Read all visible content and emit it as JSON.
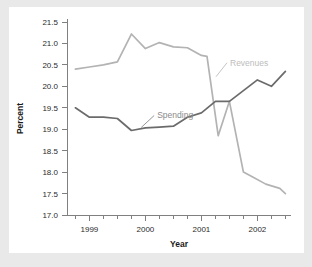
{
  "chart_data": {
    "type": "line",
    "title": "",
    "xlabel": "Year",
    "ylabel": "Percent",
    "ylim": [
      17.0,
      21.5
    ],
    "ytick_labels": [
      "21.5",
      "21.0",
      "20.5",
      "20.0",
      "19.5",
      "19.0",
      "18.5",
      "18.0",
      "17.5",
      "17.0"
    ],
    "ytick_values": [
      21.5,
      21.0,
      20.5,
      20.0,
      19.5,
      19.0,
      18.5,
      18.0,
      17.5,
      17.0
    ],
    "xtick_labels": [
      "1999",
      "2000",
      "2001",
      "2002"
    ],
    "xtick_values": [
      1999,
      2000,
      2001,
      2002
    ],
    "xlim": [
      1998.6,
      2002.6
    ],
    "x_minor_step": 0.25,
    "grid": false,
    "legend": "inline-labels",
    "series": [
      {
        "name": "Revenues",
        "color": "#b3b3b3",
        "label_color": "#bdbdbd",
        "x": [
          1998.75,
          1999.0,
          1999.25,
          1999.5,
          1999.75,
          2000.0,
          2000.25,
          2000.5,
          2000.75,
          2001.0,
          2001.1,
          2001.3,
          2001.5,
          2001.75,
          2001.9,
          2002.15,
          2002.4,
          2002.5
        ],
        "values": [
          20.4,
          20.45,
          20.5,
          20.57,
          21.22,
          20.88,
          21.02,
          20.92,
          20.9,
          20.72,
          20.7,
          18.85,
          19.65,
          18.0,
          17.9,
          17.72,
          17.62,
          17.5
        ]
      },
      {
        "name": "Spending",
        "color": "#6b6b6b",
        "label_color": "#8a8a8a",
        "x": [
          1998.75,
          1999.0,
          1999.25,
          1999.5,
          1999.75,
          2000.0,
          2000.25,
          2000.5,
          2000.75,
          2001.0,
          2001.25,
          2001.5,
          2001.75,
          2002.0,
          2002.25,
          2002.5
        ],
        "values": [
          19.5,
          19.28,
          19.28,
          19.25,
          18.97,
          19.03,
          19.05,
          19.07,
          19.28,
          19.38,
          19.65,
          19.65,
          19.9,
          20.15,
          20.0,
          20.35
        ]
      }
    ],
    "annotations": [
      {
        "text": "Revenues",
        "x": 2001.35,
        "y": 20.55
      },
      {
        "text": "Spending",
        "x": 2000.05,
        "y": 19.32
      }
    ]
  }
}
